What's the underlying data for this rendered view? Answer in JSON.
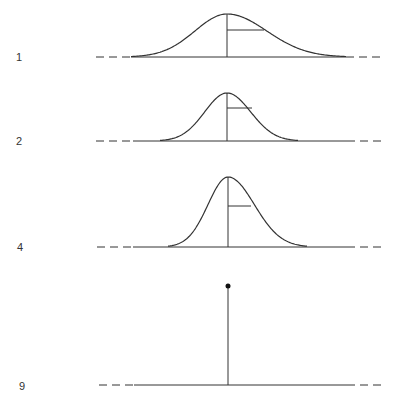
{
  "figure": {
    "panels": [
      {
        "label": "1",
        "label_x": 16,
        "label_y": 51,
        "baseline_y": 57,
        "peak_y": 14,
        "center_x": 227,
        "left_x": 131,
        "right_x": 346,
        "marker_y": 30,
        "marker_end_x": 264,
        "dash_left": [
          96,
          131
        ],
        "dash_right": [
          346,
          382
        ]
      },
      {
        "label": "2",
        "label_x": 16,
        "label_y": 135,
        "baseline_y": 141,
        "peak_y": 93,
        "center_x": 227,
        "left_x": 160,
        "right_x": 298,
        "marker_y": 108,
        "marker_end_x": 252,
        "dash_left": [
          96,
          133
        ],
        "dash_right": [
          347,
          382
        ]
      },
      {
        "label": "4",
        "label_x": 17,
        "label_y": 241,
        "baseline_y": 247,
        "peak_y": 177,
        "center_x": 228,
        "left_x": 168,
        "right_x": 307,
        "marker_y": 206,
        "marker_end_x": 251,
        "dash_left": [
          97,
          133
        ],
        "dash_right": [
          347,
          382
        ]
      },
      {
        "label": "9",
        "label_x": 19,
        "label_y": 380,
        "baseline_y": 385,
        "spike_top_y": 286,
        "center_x": 228,
        "dash_left": [
          99,
          134
        ],
        "dash_right": [
          347,
          383
        ]
      }
    ],
    "line_color": "#333333"
  }
}
